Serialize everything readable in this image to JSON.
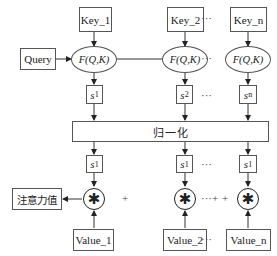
{
  "diagram": {
    "keys": [
      "Key_1",
      "Key_2",
      "Key_n"
    ],
    "query_label": "Query",
    "score_fn": "F(Q,K)",
    "scores": [
      {
        "base": "s",
        "sub": "1"
      },
      {
        "base": "s",
        "sub": "2"
      },
      {
        "base": "s",
        "sub": "n"
      }
    ],
    "normalize_label": "归一化",
    "normalized_scores": [
      {
        "base": "s",
        "sub": "1"
      },
      {
        "base": "s",
        "sub": "1"
      },
      {
        "base": "s",
        "sub": "1"
      }
    ],
    "multiply_symbol": "✱",
    "plus_symbol": "+",
    "ellipsis": "···",
    "values": [
      "Value_1",
      "Value_2",
      "Value_n"
    ],
    "output_label": "注意力值"
  }
}
